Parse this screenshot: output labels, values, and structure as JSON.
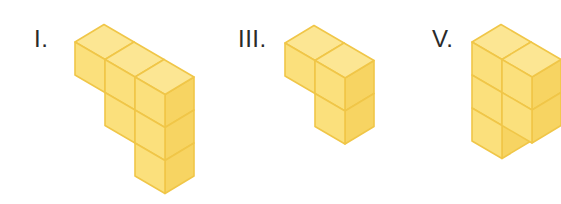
{
  "figures": [
    {
      "id": "figure-1",
      "label": "I.",
      "label_pos": [
        34,
        27
      ],
      "origin": [
        75,
        42
      ],
      "columns": [
        1,
        2,
        3
      ]
    },
    {
      "id": "figure-3",
      "label": "III.",
      "label_pos": [
        238,
        27
      ],
      "origin": [
        285,
        43
      ],
      "columns": [
        1,
        2
      ]
    },
    {
      "id": "figure-5",
      "label": "V.",
      "label_pos": [
        432,
        27
      ],
      "origin": [
        472,
        42
      ],
      "columns": [
        3,
        2
      ]
    }
  ],
  "geometry": {
    "row_vector": [
      30,
      17.5
    ],
    "depth_vector": [
      29,
      -17.5
    ],
    "vertical_vector": [
      0,
      33
    ]
  },
  "colors": {
    "top_face": "#FCE693",
    "front_face": "#FBE07C",
    "right_face": "#F7D462",
    "edge": "#F0C648",
    "label": "#2a2a2a"
  }
}
